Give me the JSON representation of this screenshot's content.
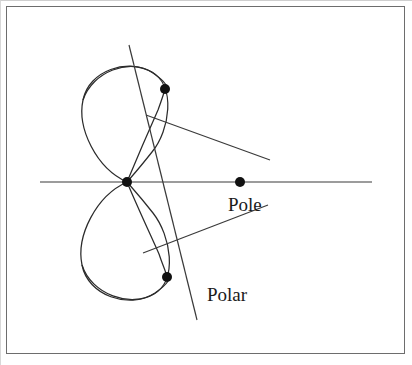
{
  "figure": {
    "background_color": "#ffffff",
    "stroke_color": "#2b2b2b",
    "frame_color": "#6d6d6d",
    "point_color": "#111111",
    "canvas": {
      "width": 412,
      "height": 365
    },
    "frame": {
      "x": 6,
      "y": 6,
      "width": 399,
      "height": 348
    }
  },
  "labels": {
    "pole": "Pole",
    "polar": "Polar"
  },
  "label_positions": {
    "pole": {
      "x": 228,
      "y": 195
    },
    "polar": {
      "x": 207,
      "y": 285
    }
  },
  "points": [
    {
      "name": "node",
      "x": 127,
      "y": 182,
      "radius": 5.2
    },
    {
      "name": "tangency-upper",
      "x": 165,
      "y": 89,
      "radius": 5.2
    },
    {
      "name": "tangency-lower",
      "x": 167,
      "y": 277,
      "radius": 5.2
    },
    {
      "name": "pole",
      "x": 240,
      "y": 182,
      "radius": 5.2
    }
  ],
  "axis_line": {
    "name": "horizontal-axis",
    "x1": 40,
    "y1": 182,
    "x2": 372,
    "y2": 182
  },
  "polar_line": {
    "name": "polar-line",
    "x1": 129,
    "y1": 45,
    "x2": 197,
    "y2": 320
  },
  "tangent_lines": [
    {
      "name": "tangent-upper",
      "x1": 146,
      "y1": 115,
      "x2": 270,
      "y2": 160
    },
    {
      "name": "tangent-lower",
      "x1": 143,
      "y1": 253,
      "x2": 268,
      "y2": 205
    }
  ],
  "curve_paths": {
    "upper_loop": "M127,182 C96,168 77,128 83,100 C89,70 128,58 152,72 C176,86 170,130 152,152 C137,171 133,175 127,182",
    "lower_loop": "M127,182 C96,196 76,236 82,265 C88,296 129,309 154,294 C178,280 171,236 153,213 C138,194 133,189 127,182",
    "upper_inner": "M127,182 C140,162 152,140 158,118 C162,102 164,95 165,89",
    "lower_inner": "M127,182 C140,202 153,225 159,248 C163,263 165,271 167,277"
  },
  "chart_data": {
    "type": "diagram",
    "annotations": [
      "Pole",
      "Polar"
    ],
    "marked_points": [
      "node",
      "tangency-upper",
      "tangency-lower",
      "pole"
    ]
  }
}
